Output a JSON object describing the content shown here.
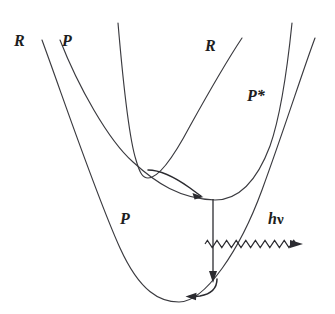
{
  "figure": {
    "background_color": "#ffffff",
    "stroke_color": "#3a3a3f",
    "width": 335,
    "height": 314,
    "labels": {
      "r_left": "R",
      "p_left": "P",
      "r_right": "R",
      "p_star": "P*",
      "p_lower": "P",
      "h_nu_h": "h",
      "h_nu_nu": "ν"
    },
    "curves": [
      {
        "name": "reactant-curve-R",
        "label": "R",
        "type": "parabola",
        "vertex": [
          146,
          178
        ],
        "left_end": [
          118,
          23
        ],
        "right_end": [
          242,
          38
        ]
      },
      {
        "name": "excited-product-curve-P-star",
        "label": "P*",
        "type": "parabola",
        "vertex": [
          215,
          200
        ],
        "left_end": [
          60,
          40
        ],
        "right_end": [
          292,
          23
        ]
      },
      {
        "name": "ground-product-curve-P",
        "label": "P",
        "type": "parabola",
        "vertex": [
          179,
          302
        ],
        "left_end": [
          42,
          40
        ],
        "right_end": [
          315,
          38
        ]
      }
    ],
    "arrows": [
      {
        "name": "crossing-transition-arrow",
        "style": "curved",
        "direction": "right-down",
        "from": [
          148,
          170
        ],
        "to": [
          203,
          196
        ]
      },
      {
        "name": "emission-vertical-arrow",
        "style": "straight",
        "direction": "down",
        "from": [
          213,
          199
        ],
        "to": [
          213,
          281
        ]
      },
      {
        "name": "relaxation-bottom-arrow",
        "style": "curved",
        "direction": "left",
        "from": [
          216,
          282
        ],
        "to": [
          186,
          296
        ]
      },
      {
        "name": "photon-emission-wave-arrow",
        "style": "wavy",
        "direction": "right",
        "from": [
          205,
          244
        ],
        "to": [
          301,
          244
        ],
        "label": "hν"
      }
    ]
  }
}
